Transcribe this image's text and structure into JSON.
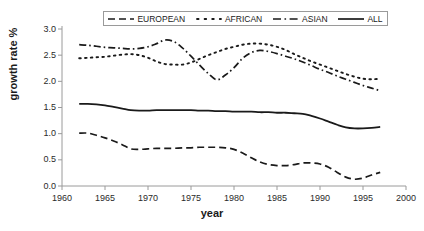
{
  "chart_data": {
    "type": "line",
    "title": "",
    "xlabel": "year",
    "ylabel": "growth rate  %",
    "xlim": [
      1960,
      2000
    ],
    "ylim": [
      0.0,
      3.0
    ],
    "xticks": [
      "1960",
      "1965",
      "1970",
      "1975",
      "1980",
      "1985",
      "1990",
      "1995",
      "2000"
    ],
    "yticks": [
      "0.0",
      "0.5",
      "1.0",
      "1.5",
      "2.0",
      "2.5",
      "3.0"
    ],
    "grid": false,
    "legend_position": "top-center",
    "x": [
      1962,
      1963,
      1964,
      1965,
      1966,
      1967,
      1968,
      1969,
      1970,
      1971,
      1972,
      1973,
      1974,
      1975,
      1976,
      1977,
      1978,
      1979,
      1980,
      1981,
      1982,
      1983,
      1984,
      1985,
      1986,
      1987,
      1988,
      1989,
      1990,
      1991,
      1992,
      1993,
      1994,
      1995,
      1996,
      1997
    ],
    "series": [
      {
        "name": "EUROPEAN",
        "style": "dashed",
        "color": "#1a1a1a",
        "values": [
          1.01,
          1.01,
          0.97,
          0.92,
          0.86,
          0.79,
          0.71,
          0.7,
          0.71,
          0.72,
          0.72,
          0.72,
          0.73,
          0.73,
          0.74,
          0.74,
          0.74,
          0.73,
          0.7,
          0.63,
          0.54,
          0.46,
          0.41,
          0.39,
          0.39,
          0.41,
          0.44,
          0.44,
          0.42,
          0.36,
          0.26,
          0.17,
          0.13,
          0.15,
          0.21,
          0.26
        ]
      },
      {
        "name": "AFRICAN",
        "style": "dotted",
        "color": "#1a1a1a",
        "values": [
          2.44,
          2.45,
          2.46,
          2.47,
          2.49,
          2.51,
          2.52,
          2.5,
          2.45,
          2.38,
          2.33,
          2.32,
          2.32,
          2.36,
          2.43,
          2.5,
          2.56,
          2.62,
          2.66,
          2.7,
          2.72,
          2.72,
          2.7,
          2.66,
          2.6,
          2.52,
          2.45,
          2.38,
          2.32,
          2.26,
          2.2,
          2.14,
          2.09,
          2.05,
          2.04,
          2.05
        ]
      },
      {
        "name": "ASIAN",
        "style": "dashdot",
        "color": "#1a1a1a",
        "values": [
          2.7,
          2.69,
          2.67,
          2.65,
          2.64,
          2.63,
          2.62,
          2.63,
          2.66,
          2.72,
          2.79,
          2.76,
          2.64,
          2.48,
          2.31,
          2.15,
          2.03,
          2.12,
          2.26,
          2.44,
          2.55,
          2.59,
          2.57,
          2.53,
          2.48,
          2.43,
          2.37,
          2.3,
          2.23,
          2.17,
          2.1,
          2.04,
          1.98,
          1.92,
          1.87,
          1.82
        ]
      },
      {
        "name": "ALL",
        "style": "solid",
        "color": "#1a1a1a",
        "values": [
          1.57,
          1.57,
          1.56,
          1.54,
          1.51,
          1.48,
          1.45,
          1.44,
          1.44,
          1.45,
          1.45,
          1.45,
          1.45,
          1.45,
          1.44,
          1.44,
          1.43,
          1.43,
          1.42,
          1.42,
          1.42,
          1.41,
          1.41,
          1.4,
          1.4,
          1.39,
          1.38,
          1.34,
          1.29,
          1.23,
          1.17,
          1.12,
          1.1,
          1.1,
          1.11,
          1.13
        ]
      }
    ]
  },
  "legend": {
    "items": [
      {
        "label": "EUROPEAN",
        "style": "dashed"
      },
      {
        "label": "AFRICAN",
        "style": "dotted"
      },
      {
        "label": "ASIAN",
        "style": "dashdot"
      },
      {
        "label": "ALL",
        "style": "solid"
      }
    ]
  },
  "axes": {
    "y_title": "growth rate  %",
    "x_title": "year"
  }
}
